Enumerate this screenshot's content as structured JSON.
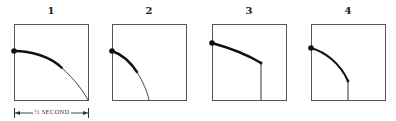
{
  "figure": {
    "panels": [
      {
        "label": "1",
        "description": "ball leaves edge, long parabolic arc reaching bottom right corner"
      },
      {
        "label": "2",
        "description": "ball leaves edge, shorter steep arc reaching bottom"
      },
      {
        "label": "3",
        "description": "ball moves in straight diagonal line then drops vertically"
      },
      {
        "label": "4",
        "description": "ball follows curved arc then drops vertically"
      }
    ],
    "dimension": {
      "label": "½ SECOND",
      "applies_to_panel": "1"
    }
  },
  "colors": {
    "frame": "#555555",
    "trajectory": "#111111",
    "background": "#ffffff"
  }
}
